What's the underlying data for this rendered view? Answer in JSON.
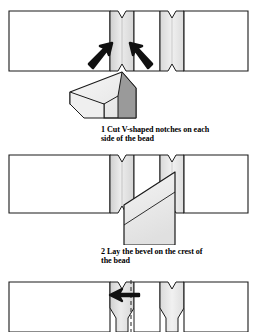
{
  "document": {
    "kind": "woodworking-instruction-illustration",
    "title": "Cutting and beading a board edge",
    "background_color": "#ffffff",
    "ink_color": "#000000"
  },
  "palette": {
    "outline": "#1a1a1a",
    "board_face": "#ffffff",
    "notch_light": "#e8e8e8",
    "notch_mid": "#d2d2d2",
    "notch_shadow": "#bdbdbd",
    "tool_light": "#f2f2f2",
    "tool_mid": "#d8d8d8",
    "tool_dark": "#9a9a9a",
    "arrow_fill": "#111111",
    "dash_line": "#333333"
  },
  "steps": [
    {
      "number": "1",
      "caption": "1 Cut V-shaped notches on each\nside of the bead",
      "panel_name": "panel-notching",
      "elements": {
        "board_label": "board-blank",
        "notch_count": 3,
        "arrow_count": 2,
        "arrow_direction": "inward-up",
        "tool_label": "chisel-bevel-down"
      }
    },
    {
      "number": "2",
      "caption": "2 Lay the bevel on the crest of\nthe bead",
      "panel_name": "panel-bevel",
      "elements": {
        "board_label": "board-notched",
        "notch_count": 3,
        "tool_label": "chisel-blade-angled",
        "bevel_line": "diagonal-bevel"
      }
    },
    {
      "number": "3",
      "caption": "",
      "panel_name": "panel-rounding",
      "elements": {
        "board_label": "board-beaded",
        "notch_count": 3,
        "arrow_count": 1,
        "arrow_direction": "left",
        "centerline": "dashed-vertical"
      }
    }
  ]
}
